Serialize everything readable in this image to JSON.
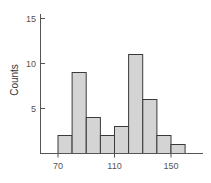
{
  "chart_data": {
    "type": "bar",
    "subtype": "histogram",
    "title": "",
    "xlabel": "",
    "ylabel": "Counts",
    "bins": [
      [
        70,
        80
      ],
      [
        80,
        90
      ],
      [
        90,
        100
      ],
      [
        100,
        110
      ],
      [
        110,
        120
      ],
      [
        120,
        130
      ],
      [
        130,
        140
      ],
      [
        140,
        150
      ],
      [
        150,
        160
      ]
    ],
    "categories": [
      "70-80",
      "80-90",
      "90-100",
      "100-110",
      "110-120",
      "120-130",
      "130-140",
      "140-150",
      "150-160"
    ],
    "values": [
      2,
      9,
      4,
      2,
      3,
      11,
      6,
      2,
      1
    ],
    "xlim": [
      60,
      170
    ],
    "ylim": [
      0,
      15
    ],
    "xticks": [
      70,
      110,
      150
    ],
    "yticks": [
      5,
      10,
      15
    ],
    "grid": false,
    "legend": null,
    "colors": {
      "bar_fill": "#d4d4d4",
      "bar_edge": "#3a3a3a",
      "axis": "#555555"
    }
  },
  "labels": {
    "ylabel": "Counts",
    "xticks": [
      "70",
      "110",
      "150"
    ],
    "yticks": [
      "5",
      "10",
      "15"
    ]
  }
}
